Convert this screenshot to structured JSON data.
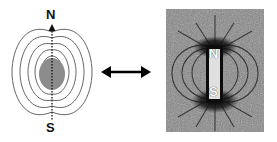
{
  "left_diagram": {
    "north_label": "N",
    "south_label": "S",
    "sphere_color": "#8c8c8c",
    "field_line_color": "#555555"
  },
  "connector": {
    "icon": "double-headed-arrow",
    "color": "#000000"
  },
  "photo": {
    "north_label": "N",
    "south_label": "S",
    "background_color": "#8a8a8a",
    "magnet_color": "#e0e0e0"
  }
}
